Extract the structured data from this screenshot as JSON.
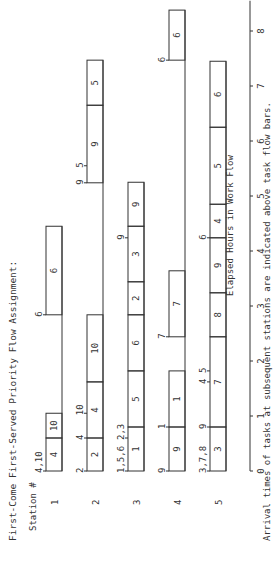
{
  "title": "First-Come First-Served Priority Flow Assignment:",
  "station_header": "Station #",
  "xlabel": "Elapsed Hours in Work Flow",
  "footnote": "Arrival times of tasks at subsequent stations are indicated above task flow bars.",
  "colors": {
    "line": "#333333",
    "background": "#ffffff"
  },
  "chart_data": {
    "type": "gantt",
    "title": "First-Come First-Served Priority Flow Assignment:",
    "xlabel": "Elapsed Hours in Work Flow",
    "ylabel": "Station #",
    "xlim": [
      0,
      8
    ],
    "xticks": [
      0,
      1,
      2,
      3,
      4,
      5,
      6,
      7,
      8
    ],
    "stations": [
      {
        "station": "1",
        "tasks": [
          {
            "task": "4",
            "start": 0,
            "end": 0.6
          },
          {
            "task": "10",
            "start": 0.6,
            "end": 1.05
          },
          {
            "task": "6",
            "start": 2.84,
            "end": 4.45
          }
        ],
        "arrivals": [
          {
            "label": "4,10",
            "t": 0
          },
          {
            "label": "6",
            "t": 2.84
          }
        ]
      },
      {
        "station": "2",
        "tasks": [
          {
            "task": "2",
            "start": 0,
            "end": 0.6
          },
          {
            "task": "4",
            "start": 0.6,
            "end": 1.62
          },
          {
            "task": "10",
            "start": 1.62,
            "end": 2.84
          },
          {
            "task": "9",
            "start": 5.24,
            "end": 6.65
          },
          {
            "task": "5",
            "start": 6.65,
            "end": 7.47
          }
        ],
        "arrivals": [
          {
            "label": "2",
            "t": 0
          },
          {
            "label": "4",
            "t": 0.6
          },
          {
            "label": "10",
            "t": 1.05
          },
          {
            "label": "9",
            "t": 5.24
          },
          {
            "label": "5",
            "t": 5.55
          }
        ]
      },
      {
        "station": "3",
        "tasks": [
          {
            "task": "1",
            "start": 0,
            "end": 0.8
          },
          {
            "task": "5",
            "start": 0.8,
            "end": 1.82
          },
          {
            "task": "6",
            "start": 1.82,
            "end": 2.84
          },
          {
            "task": "2",
            "start": 2.84,
            "end": 3.44
          },
          {
            "task": "3",
            "start": 3.44,
            "end": 4.45
          },
          {
            "task": "9",
            "start": 4.45,
            "end": 5.25
          }
        ],
        "arrivals": [
          {
            "label": "1,5,6",
            "t": 0
          },
          {
            "label": "2,3",
            "t": 0.6
          },
          {
            "label": "9",
            "t": 4.24
          }
        ]
      },
      {
        "station": "4",
        "tasks": [
          {
            "task": "9",
            "start": 0,
            "end": 0.8
          },
          {
            "task": "1",
            "start": 0.8,
            "end": 1.82
          },
          {
            "task": "7",
            "start": 2.44,
            "end": 3.64
          },
          {
            "task": "6",
            "start": 7.47,
            "end": 8.38
          }
        ],
        "arrivals": [
          {
            "label": "9",
            "t": 0
          },
          {
            "label": "1",
            "t": 0.8
          },
          {
            "label": "7",
            "t": 2.44
          },
          {
            "label": "6",
            "t": 7.47
          }
        ]
      },
      {
        "station": "5",
        "tasks": [
          {
            "task": "3",
            "start": 0,
            "end": 0.8
          },
          {
            "task": "7",
            "start": 0.8,
            "end": 2.44
          },
          {
            "task": "8",
            "start": 2.44,
            "end": 3.24
          },
          {
            "task": "9",
            "start": 3.24,
            "end": 4.24
          },
          {
            "task": "4",
            "start": 4.24,
            "end": 4.85
          },
          {
            "task": "5",
            "start": 4.85,
            "end": 6.25
          },
          {
            "task": "6",
            "start": 6.25,
            "end": 7.45
          }
        ],
        "arrivals": [
          {
            "label": "3,7,8",
            "t": 0
          },
          {
            "label": "9",
            "t": 0.8
          },
          {
            "label": "4",
            "t": 1.62
          },
          {
            "label": "5",
            "t": 1.82
          },
          {
            "label": "6",
            "t": 4.24
          }
        ]
      }
    ]
  }
}
